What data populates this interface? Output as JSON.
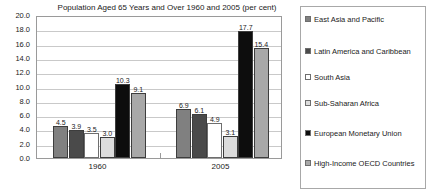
{
  "chart_data": {
    "type": "bar",
    "title": "Population Aged 65 Years and Over 1960 and 2005 (per cent)",
    "xlabel": "",
    "ylabel": "",
    "ylim": [
      0,
      20
    ],
    "ytick_step": 2,
    "grid": true,
    "legend_position": "right",
    "categories": [
      "1960",
      "2005"
    ],
    "ytick_labels": [
      "20.0",
      "18.0",
      "16.0",
      "14.0",
      "12.0",
      "10.0",
      "8.0",
      "6.0",
      "4.0",
      "2.0",
      "0.0"
    ],
    "series": [
      {
        "name": "East Asia and Pacific",
        "color": "#808080",
        "values": [
          4.5,
          6.9
        ]
      },
      {
        "name": "Latin America and Caribbean",
        "color": "#4a4a4a",
        "values": [
          3.9,
          6.1
        ]
      },
      {
        "name": "South Asia",
        "color": "#ffffff",
        "values": [
          3.5,
          4.9
        ]
      },
      {
        "name": "Sub-Saharan Africa",
        "color": "#dcdcdc",
        "values": [
          3.0,
          3.1
        ]
      },
      {
        "name": "European Monetary Union",
        "color": "#0d0d0d",
        "values": [
          10.3,
          17.7
        ]
      },
      {
        "name": "High-Income OECD Countries",
        "color": "#a8a8a8",
        "values": [
          9.1,
          15.4
        ]
      }
    ],
    "value_labels": {
      "1960": [
        "4.5",
        "3.9",
        "3.5",
        "3.0",
        "10.3",
        "9.1"
      ],
      "2005": [
        "6.9",
        "6.1",
        "4.9",
        "3.1",
        "17.7",
        "15.4"
      ]
    }
  },
  "legend": {
    "entries": [
      {
        "label": "East Asia and Pacific",
        "color": "#808080"
      },
      {
        "label": "Latin America and Caribbean",
        "color": "#4a4a4a"
      },
      {
        "label": "South Asia",
        "color": "#ffffff"
      },
      {
        "label": "Sub-Saharan Africa",
        "color": "#dcdcdc"
      },
      {
        "label": "European Monetary Union",
        "color": "#0d0d0d"
      },
      {
        "label": "High-Income OECD Countries",
        "color": "#a8a8a8"
      }
    ]
  }
}
